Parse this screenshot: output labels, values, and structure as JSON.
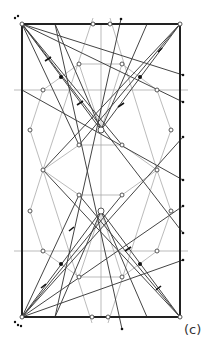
{
  "figure": {
    "label": "(c)",
    "colors": {
      "frame": "#222222",
      "line": "#444444",
      "guide": "#aaaaaa",
      "point_fill": "#ffffff",
      "marker": "#111111"
    }
  },
  "geometry": {
    "rectangle": {
      "x1": 22,
      "y1": 24,
      "x2": 180,
      "y2": 317
    },
    "hubs": [
      {
        "name": "top-hub",
        "x": 101,
        "y": 130
      },
      {
        "name": "bottom-hub",
        "x": 101,
        "y": 211
      }
    ],
    "corners": [
      {
        "x": 22,
        "y": 24
      },
      {
        "x": 180,
        "y": 24
      },
      {
        "x": 22,
        "y": 317
      },
      {
        "x": 180,
        "y": 317
      }
    ]
  }
}
